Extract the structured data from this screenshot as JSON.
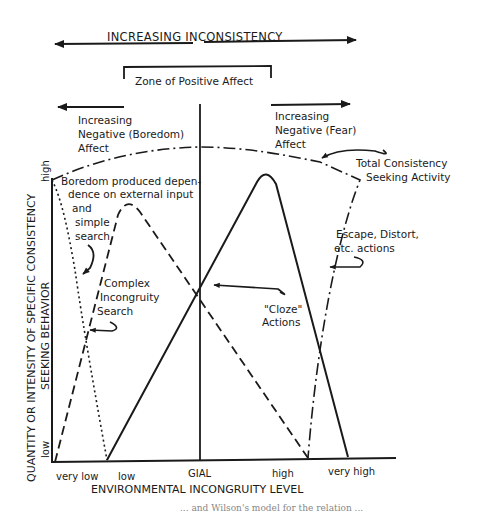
{
  "title": "INCREASING INCONSISTENCY",
  "zone_label": "Zone of Positive Affect",
  "left_region": {
    "line1": "Increasing",
    "line2": "Negative (Boredom)",
    "line3": "Affect"
  },
  "right_region": {
    "line1": "Increasing",
    "line2": "Negative (Fear)",
    "line3": "Affect"
  },
  "annotations": {
    "boredom": [
      "Boredom produced depen-",
      "dence on external input",
      "and",
      "simple",
      "search"
    ],
    "complex": [
      "Complex",
      "Incongruity",
      "Search"
    ],
    "cloze": [
      "\"Cloze\"",
      "Actions"
    ],
    "total": [
      "Total Consistency",
      "Seeking Activity"
    ],
    "escape": [
      "Escape, Distort,",
      "etc. actions"
    ]
  },
  "y_axis": {
    "label_line1": "QUANTITY OR INTENSITY OF SPECIFIC CONSISTENCY",
    "label_line2": "SEEKING BEHAVIOR",
    "high": "high",
    "low": "low"
  },
  "x_axis": {
    "label": "ENVIRONMENTAL INCONGRUITY LEVEL",
    "ticks": [
      "very low",
      "low",
      "GIAL",
      "high",
      "very high"
    ]
  },
  "caption_partial": "... and Wilson's model for the relation ..."
}
